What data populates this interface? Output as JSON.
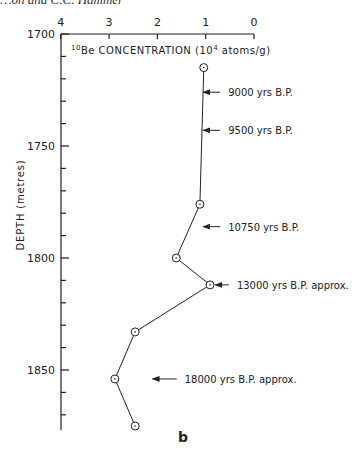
{
  "header": {
    "running_text": "…on and C.C. Hammer"
  },
  "panel_label": "b",
  "chart_data": {
    "type": "line",
    "title": "",
    "xlabel": "10Be CONCENTRATION (10^4 atoms/g)",
    "xlabel_parts": {
      "sup1": "10",
      "pre": "Be CONCENTRATION (10",
      "sup2": "4",
      "post": " atoms/g)"
    },
    "ylabel": "DEPTH (metres)",
    "x_axis": {
      "position": "top",
      "reversed": true,
      "range": [
        4,
        0
      ],
      "ticks": [
        4,
        3,
        2,
        1,
        0
      ],
      "tick_labels": [
        "4",
        "3",
        "2",
        "1",
        "0"
      ]
    },
    "y_axis": {
      "reversed": true,
      "range": [
        1700,
        1880
      ],
      "major_ticks": [
        1700,
        1750,
        1800,
        1850
      ],
      "tick_labels": [
        "1700",
        "1750",
        "1800",
        "1850"
      ],
      "minor_step": 10
    },
    "grid": false,
    "series": [
      {
        "name": "10Be concentration",
        "marker": "circle-dot",
        "points": [
          {
            "x": 1.04,
            "y": 1715
          },
          {
            "x": 1.12,
            "y": 1776
          },
          {
            "x": 1.61,
            "y": 1800
          },
          {
            "x": 0.91,
            "y": 1812
          },
          {
            "x": 2.46,
            "y": 1833
          },
          {
            "x": 2.88,
            "y": 1854
          },
          {
            "x": 2.46,
            "y": 1875
          }
        ]
      }
    ],
    "annotations": [
      {
        "text": "9000 yrs B.P.",
        "depth": 1726,
        "arrow_from_x": 0.7,
        "arrow_to_x": 1.05
      },
      {
        "text": "9500 yrs B.P.",
        "depth": 1743,
        "arrow_from_x": 0.7,
        "arrow_to_x": 1.05
      },
      {
        "text": "10750 yrs B.P.",
        "depth": 1786,
        "arrow_from_x": 0.7,
        "arrow_to_x": 1.05
      },
      {
        "text": "13000 yrs B.P. approx.",
        "depth": 1812,
        "arrow_from_x": 0.52,
        "arrow_to_x": 0.8
      },
      {
        "text": "18000 yrs B.P. approx.",
        "depth": 1854,
        "arrow_from_x": 1.6,
        "arrow_to_x": 2.1
      }
    ]
  }
}
